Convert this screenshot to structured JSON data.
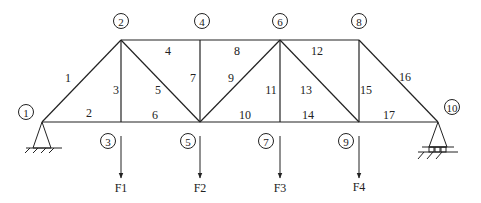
{
  "diagram": {
    "type": "truss",
    "nodes": [
      {
        "id": "1",
        "x": 42,
        "y": 122,
        "label_x": 26,
        "label_y": 112
      },
      {
        "id": "2",
        "x": 121,
        "y": 40,
        "label_x": 121,
        "label_y": 21
      },
      {
        "id": "3",
        "x": 121,
        "y": 122,
        "label_x": 108,
        "label_y": 141
      },
      {
        "id": "4",
        "x": 200,
        "y": 40,
        "label_x": 202,
        "label_y": 21
      },
      {
        "id": "5",
        "x": 200,
        "y": 122,
        "label_x": 188,
        "label_y": 141
      },
      {
        "id": "6",
        "x": 280,
        "y": 40,
        "label_x": 280,
        "label_y": 21
      },
      {
        "id": "7",
        "x": 280,
        "y": 122,
        "label_x": 266,
        "label_y": 141
      },
      {
        "id": "8",
        "x": 359,
        "y": 40,
        "label_x": 359,
        "label_y": 21
      },
      {
        "id": "9",
        "x": 359,
        "y": 122,
        "label_x": 346,
        "label_y": 141
      },
      {
        "id": "10",
        "x": 438,
        "y": 122,
        "label_x": 452,
        "label_y": 107
      }
    ],
    "members": [
      {
        "id": "1",
        "from": "1",
        "to": "2",
        "label_x": 68,
        "label_y": 82
      },
      {
        "id": "2",
        "from": "1",
        "to": "3",
        "label_x": 89,
        "label_y": 117
      },
      {
        "id": "3",
        "from": "2",
        "to": "3",
        "label_x": 116,
        "label_y": 94
      },
      {
        "id": "4",
        "from": "2",
        "to": "4",
        "label_x": 168,
        "label_y": 55
      },
      {
        "id": "5",
        "from": "2",
        "to": "5",
        "label_x": 158,
        "label_y": 94
      },
      {
        "id": "6",
        "from": "3",
        "to": "5",
        "label_x": 155,
        "label_y": 119
      },
      {
        "id": "7",
        "from": "4",
        "to": "5",
        "label_x": 193,
        "label_y": 82
      },
      {
        "id": "8",
        "from": "4",
        "to": "6",
        "label_x": 237,
        "label_y": 55
      },
      {
        "id": "9",
        "from": "5",
        "to": "6",
        "label_x": 231,
        "label_y": 82
      },
      {
        "id": "10",
        "from": "5",
        "to": "7",
        "label_x": 245,
        "label_y": 119
      },
      {
        "id": "11",
        "from": "6",
        "to": "7",
        "label_x": 271,
        "label_y": 94
      },
      {
        "id": "12",
        "from": "6",
        "to": "8",
        "label_x": 317,
        "label_y": 55
      },
      {
        "id": "13",
        "from": "6",
        "to": "9",
        "label_x": 306,
        "label_y": 94
      },
      {
        "id": "14",
        "from": "7",
        "to": "9",
        "label_x": 308,
        "label_y": 119
      },
      {
        "id": "15",
        "from": "8",
        "to": "9",
        "label_x": 366,
        "label_y": 94
      },
      {
        "id": "16",
        "from": "8",
        "to": "10",
        "label_x": 405,
        "label_y": 81
      },
      {
        "id": "17",
        "from": "9",
        "to": "10",
        "label_x": 389,
        "label_y": 119
      }
    ],
    "loads": [
      {
        "label": "F1",
        "x": 121,
        "y_start": 136,
        "y_end": 178,
        "label_y": 192
      },
      {
        "label": "F2",
        "x": 200,
        "y_start": 136,
        "y_end": 178,
        "label_y": 192
      },
      {
        "label": "F3",
        "x": 280,
        "y_start": 136,
        "y_end": 178,
        "label_y": 192
      },
      {
        "label": "F4",
        "x": 359,
        "y_start": 136,
        "y_end": 178,
        "label_y": 191
      }
    ],
    "supports": [
      {
        "node": "1",
        "type": "pin"
      },
      {
        "node": "10",
        "type": "roller"
      }
    ]
  }
}
